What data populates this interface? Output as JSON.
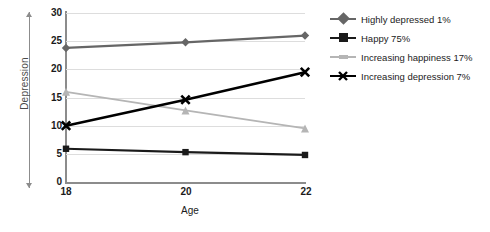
{
  "chart_data": {
    "type": "line",
    "title": "",
    "xlabel": "Age",
    "ylabel": "Depression",
    "x": [
      18,
      20,
      22
    ],
    "categories": [
      "18",
      "20",
      "22"
    ],
    "xlim": [
      18,
      22
    ],
    "ylim": [
      0,
      30
    ],
    "yticks": [
      0,
      5,
      10,
      15,
      20,
      25,
      30
    ],
    "xticks": [
      18,
      20,
      22
    ],
    "grid": true,
    "legend_position": "right",
    "series": [
      {
        "name": "Highly depressed 1%",
        "label": "Highly depressed 1%",
        "values": [
          23.8,
          24.8,
          26.0
        ],
        "color": "#666666",
        "marker": "diamond"
      },
      {
        "name": "Happy 75%",
        "label": "Happy 75%",
        "values": [
          5.9,
          5.3,
          4.8
        ],
        "color": "#1a1a1a",
        "marker": "square"
      },
      {
        "name": "Increasing happiness 17%",
        "label": "Increasing happiness 17%",
        "values": [
          16.0,
          12.7,
          9.5
        ],
        "color": "#b5b5b5",
        "marker": "triangle"
      },
      {
        "name": "Increasing depression 7%",
        "label": "Increasing depression 7%",
        "values": [
          10.0,
          14.6,
          19.5
        ],
        "color": "#000000",
        "marker": "x"
      }
    ]
  },
  "axes": {
    "y_title": "Depression",
    "x_title": "Age",
    "y_tick_labels": [
      "0",
      "5",
      "10",
      "15",
      "20",
      "25",
      "30"
    ],
    "x_tick_labels": [
      "18",
      "20",
      "22"
    ]
  },
  "legend": {
    "items": [
      {
        "label": "Highly depressed 1%"
      },
      {
        "label": "Happy 75%"
      },
      {
        "label": "Increasing happiness 17%"
      },
      {
        "label": "Increasing depression 7%"
      }
    ]
  },
  "colors": {
    "grid": "#dddddd",
    "axis": "#8c8c8c",
    "text": "#1b1b1b",
    "background": "#ffffff"
  }
}
